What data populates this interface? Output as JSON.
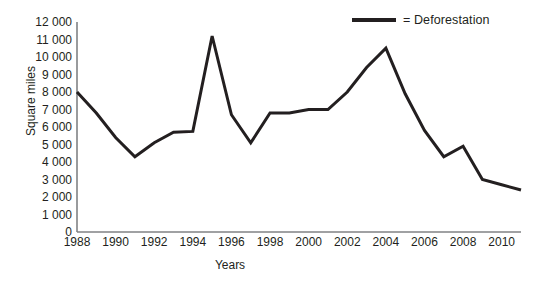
{
  "chart_data": {
    "type": "line",
    "title": "",
    "xlabel": "Years",
    "ylabel": "Square miles",
    "xlim": [
      1988,
      2011
    ],
    "ylim": [
      0,
      12000
    ],
    "grid": false,
    "legend_position": "top-right",
    "series": [
      {
        "name": "Deforestation",
        "color": "#231f20",
        "x": [
          1988,
          1989,
          1990,
          1991,
          1992,
          1993,
          1994,
          1995,
          1996,
          1997,
          1998,
          1999,
          2000,
          2001,
          2002,
          2003,
          2004,
          2005,
          2006,
          2007,
          2008,
          2009,
          2010,
          2011
        ],
        "values": [
          8000,
          6800,
          5400,
          4300,
          5100,
          5700,
          5750,
          11200,
          6700,
          5100,
          6800,
          6800,
          7000,
          7000,
          8000,
          9400,
          10500,
          7900,
          5800,
          4300,
          4900,
          3000,
          2700,
          2400
        ]
      }
    ],
    "y_ticks": [
      {
        "value": 0,
        "label": "0"
      },
      {
        "value": 1000,
        "label": "1 000"
      },
      {
        "value": 2000,
        "label": "2 000"
      },
      {
        "value": 3000,
        "label": "3 000"
      },
      {
        "value": 4000,
        "label": "4 000"
      },
      {
        "value": 5000,
        "label": "5 000"
      },
      {
        "value": 6000,
        "label": "6 000"
      },
      {
        "value": 7000,
        "label": "7 000"
      },
      {
        "value": 8000,
        "label": "8 000"
      },
      {
        "value": 9000,
        "label": "9 000"
      },
      {
        "value": 10000,
        "label": "10 000"
      },
      {
        "value": 11000,
        "label": "11 000"
      },
      {
        "value": 12000,
        "label": "12 000"
      }
    ],
    "x_ticks": [
      {
        "value": 1988,
        "label": "1988"
      },
      {
        "value": 1990,
        "label": "1990"
      },
      {
        "value": 1992,
        "label": "1992"
      },
      {
        "value": 1994,
        "label": "1994"
      },
      {
        "value": 1996,
        "label": "1996"
      },
      {
        "value": 1998,
        "label": "1998"
      },
      {
        "value": 2000,
        "label": "2000"
      },
      {
        "value": 2002,
        "label": "2002"
      },
      {
        "value": 2004,
        "label": "2004"
      },
      {
        "value": 2006,
        "label": "2006"
      },
      {
        "value": 2008,
        "label": "2008"
      },
      {
        "value": 2010,
        "label": "2010"
      }
    ]
  },
  "legend": {
    "entries": [
      {
        "label": "= Deforestation",
        "color": "#231f20"
      }
    ]
  },
  "axes": {
    "y_title": "Square miles",
    "x_title": "Years",
    "axis_color": "#808285"
  }
}
